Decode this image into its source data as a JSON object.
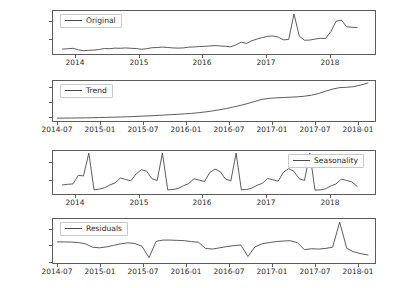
{
  "figure": {
    "background": "#ffffff",
    "line_color": "#4a4a4a",
    "axis_color": "#5b5b5b"
  },
  "chart_data": [
    {
      "type": "line",
      "title": "",
      "name": "original",
      "legend": "Original",
      "legend_position": "upper left",
      "xlabel": "",
      "ylabel": "",
      "grid": false,
      "xtick_labels": [
        "2014",
        "2015",
        "2016",
        "2017",
        "2018"
      ],
      "xtick_values": [
        2014.0,
        2015.0,
        2016.0,
        2017.0,
        2018.0
      ],
      "ytick_labels": [
        "10000",
        "20000"
      ],
      "ytick_values": [
        10000,
        20000
      ],
      "xlim": [
        2013.85,
        2018.95
      ],
      "ylim": [
        2600,
        24500
      ],
      "x": [
        2014.0,
        2014.083,
        2014.167,
        2014.25,
        2014.333,
        2014.417,
        2014.5,
        2014.583,
        2014.667,
        2014.75,
        2014.833,
        2014.917,
        2015.0,
        2015.083,
        2015.167,
        2015.25,
        2015.333,
        2015.417,
        2015.5,
        2015.583,
        2015.667,
        2015.75,
        2015.833,
        2015.917,
        2016.0,
        2016.083,
        2016.167,
        2016.25,
        2016.333,
        2016.417,
        2016.5,
        2016.583,
        2016.667,
        2016.75,
        2016.833,
        2016.917,
        2017.0,
        2017.083,
        2017.167,
        2017.25,
        2017.333,
        2017.417,
        2017.5,
        2017.583,
        2017.667,
        2017.75,
        2017.833,
        2017.917,
        2018.0,
        2018.083,
        2018.167,
        2018.25,
        2018.333,
        2018.417,
        2018.5,
        2018.583,
        2018.667
      ],
      "values": [
        5100,
        5300,
        5500,
        4700,
        4300,
        4500,
        4600,
        4900,
        5400,
        5300,
        5600,
        5500,
        5700,
        5500,
        5400,
        5000,
        5300,
        5800,
        5900,
        6100,
        5900,
        5700,
        5600,
        5700,
        6100,
        6200,
        6400,
        6500,
        6700,
        6900,
        6700,
        6500,
        6300,
        7300,
        8600,
        8000,
        9400,
        10200,
        11000,
        11600,
        11800,
        11200,
        9800,
        10000,
        23000,
        11800,
        9600,
        9700,
        10200,
        10600,
        10500,
        14000,
        19200,
        19900,
        16500,
        16200,
        16100
      ]
    },
    {
      "type": "line",
      "title": "",
      "name": "trend",
      "legend": "Trend",
      "legend_position": "upper left",
      "xlabel": "",
      "ylabel": "",
      "grid": false,
      "xtick_labels": [
        "2014-07",
        "2015-01",
        "2015-07",
        "2016-01",
        "2016-07",
        "2017-01",
        "2017-07",
        "2018-01"
      ],
      "ytick_labels": [
        "5000",
        "10000",
        "15000"
      ],
      "ytick_values": [
        5000,
        10000,
        15000
      ],
      "xlim": [
        2014.45,
        2018.25
      ],
      "ylim": [
        4300,
        16400
      ],
      "x": [
        2014.5,
        2014.583,
        2014.667,
        2014.75,
        2014.833,
        2014.917,
        2015.0,
        2015.083,
        2015.167,
        2015.25,
        2015.333,
        2015.417,
        2015.5,
        2015.583,
        2015.667,
        2015.75,
        2015.833,
        2015.917,
        2016.0,
        2016.083,
        2016.167,
        2016.25,
        2016.333,
        2016.417,
        2016.5,
        2016.583,
        2016.667,
        2016.75,
        2016.833,
        2016.917,
        2017.0,
        2017.083,
        2017.167,
        2017.25,
        2017.333,
        2017.417,
        2017.5,
        2017.583,
        2017.667,
        2017.75,
        2017.833,
        2017.917,
        2018.0,
        2018.083,
        2018.167
      ],
      "values": [
        5150,
        5180,
        5200,
        5230,
        5260,
        5300,
        5350,
        5400,
        5460,
        5520,
        5590,
        5670,
        5760,
        5860,
        5970,
        6090,
        6200,
        6320,
        6450,
        6600,
        6800,
        7050,
        7350,
        7700,
        8100,
        8550,
        9050,
        9600,
        10250,
        10850,
        11150,
        11300,
        11400,
        11500,
        11600,
        11800,
        12100,
        12600,
        13300,
        13950,
        14400,
        14500,
        14700,
        15200,
        15800
      ]
    },
    {
      "type": "line",
      "title": "",
      "name": "seasonality",
      "legend": "Seasonality",
      "legend_position": "upper right",
      "xlabel": "",
      "ylabel": "",
      "grid": false,
      "xtick_labels": [
        "2014",
        "2015",
        "2016",
        "2017",
        "2018"
      ],
      "xtick_values": [
        2014.0,
        2015.0,
        2016.0,
        2017.0,
        2018.0
      ],
      "ytick_labels": [
        "0",
        "2500"
      ],
      "ytick_values": [
        0,
        2500
      ],
      "xlim": [
        2013.85,
        2018.95
      ],
      "ylim": [
        -2000,
        4200
      ],
      "x": [
        2014.0,
        2014.083,
        2014.167,
        2014.25,
        2014.333,
        2014.417,
        2014.5,
        2014.583,
        2014.667,
        2014.75,
        2014.833,
        2014.917,
        2015.0,
        2015.083,
        2015.167,
        2015.25,
        2015.333,
        2015.417,
        2015.5,
        2015.583,
        2015.667,
        2015.75,
        2015.833,
        2015.917,
        2016.0,
        2016.083,
        2016.167,
        2016.25,
        2016.333,
        2016.417,
        2016.5,
        2016.583,
        2016.667,
        2016.75,
        2016.833,
        2016.917,
        2017.0,
        2017.083,
        2017.167,
        2017.25,
        2017.333,
        2017.417,
        2017.5,
        2017.583,
        2017.667,
        2017.75,
        2017.833,
        2017.917,
        2018.0,
        2018.083,
        2018.167,
        2018.25,
        2018.333,
        2018.417,
        2018.5,
        2018.583,
        2018.667
      ],
      "values": [
        -700,
        -600,
        -550,
        700,
        600,
        3900,
        -1400,
        -1300,
        -1100,
        -700,
        -400,
        300,
        100,
        -100,
        900,
        1500,
        1300,
        200,
        -50,
        3900,
        -1400,
        -1350,
        -1200,
        -800,
        -500,
        200,
        0,
        -200,
        1100,
        1600,
        1200,
        150,
        -100,
        3900,
        -1400,
        -1350,
        -1150,
        -750,
        -450,
        250,
        50,
        -150,
        1150,
        1650,
        1250,
        200,
        -50,
        3900,
        -1450,
        -1400,
        -1250,
        -850,
        -550,
        150,
        -50,
        -250,
        -900
      ]
    },
    {
      "type": "line",
      "title": "",
      "name": "residuals",
      "legend": "Residuals",
      "legend_position": "upper left",
      "xlabel": "",
      "ylabel": "",
      "grid": false,
      "xtick_labels": [
        "2014-07",
        "2015-01",
        "2015-07",
        "2016-01",
        "2016-07",
        "2017-01",
        "2017-07",
        "2018-01"
      ],
      "ytick_labels": [
        "5000",
        "0",
        "-5000"
      ],
      "ytick_values": [
        5000,
        0,
        -5000
      ],
      "xlim": [
        2014.45,
        2018.25
      ],
      "ylim": [
        -6000,
        8200
      ],
      "x": [
        2014.5,
        2014.583,
        2014.667,
        2014.75,
        2014.833,
        2014.917,
        2015.0,
        2015.083,
        2015.167,
        2015.25,
        2015.333,
        2015.417,
        2015.5,
        2015.583,
        2015.667,
        2015.75,
        2015.833,
        2015.917,
        2016.0,
        2016.083,
        2016.167,
        2016.25,
        2016.333,
        2016.417,
        2016.5,
        2016.583,
        2016.667,
        2016.75,
        2016.833,
        2016.917,
        2017.0,
        2017.083,
        2017.167,
        2017.25,
        2017.333,
        2017.417,
        2017.5,
        2017.583,
        2017.667,
        2017.75,
        2017.833,
        2017.917,
        2018.0,
        2018.083,
        2018.167
      ],
      "values": [
        800,
        800,
        750,
        600,
        200,
        -900,
        -1100,
        -800,
        -300,
        200,
        500,
        300,
        -600,
        -4300,
        1000,
        1400,
        1400,
        1300,
        1200,
        900,
        700,
        -1300,
        -1500,
        -1100,
        -700,
        -400,
        -200,
        -3900,
        -800,
        200,
        600,
        900,
        1100,
        1200,
        600,
        -1700,
        -1400,
        -1500,
        -1300,
        -900,
        7200,
        -1300,
        -2400,
        -3000,
        -3400
      ]
    }
  ]
}
